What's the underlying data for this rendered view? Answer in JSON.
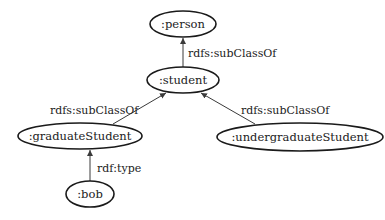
{
  "diagram": {
    "type": "rdf-graph",
    "nodes": [
      {
        "id": "person",
        "label": ":person",
        "cx": 183,
        "cy": 24,
        "rx": 33,
        "ry": 13
      },
      {
        "id": "student",
        "label": ":student",
        "cx": 183,
        "cy": 80,
        "rx": 36,
        "ry": 13
      },
      {
        "id": "graduateStudent",
        "label": ":graduateStudent",
        "cx": 80,
        "cy": 136,
        "rx": 62,
        "ry": 13
      },
      {
        "id": "undergraduateStudent",
        "label": ":undergraduateStudent",
        "cx": 300,
        "cy": 137,
        "rx": 83,
        "ry": 14
      },
      {
        "id": "bob",
        "label": ":bob",
        "cx": 90,
        "cy": 194,
        "rx": 24,
        "ry": 13
      }
    ],
    "edges": [
      {
        "from": "student",
        "to": "person",
        "label": "rdfs:subClassOf"
      },
      {
        "from": "graduateStudent",
        "to": "student",
        "label": "rdfs:subClassOf"
      },
      {
        "from": "undergraduateStudent",
        "to": "student",
        "label": "rdfs:subClassOf"
      },
      {
        "from": "bob",
        "to": "graduateStudent",
        "label": "rdf:type"
      }
    ]
  }
}
